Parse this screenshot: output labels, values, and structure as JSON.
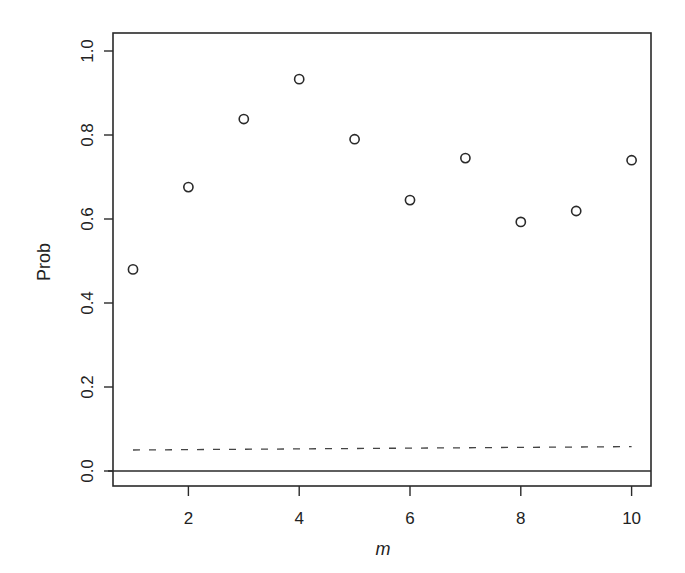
{
  "chart_data": {
    "type": "scatter",
    "title": "",
    "xlabel": "m",
    "ylabel": "Prob",
    "xlim": [
      0.65,
      10.35
    ],
    "ylim": [
      -0.04,
      1.04
    ],
    "x_ticks": [
      2,
      4,
      6,
      8,
      10
    ],
    "y_ticks": [
      0.0,
      0.2,
      0.4,
      0.6,
      0.8,
      1.0
    ],
    "x_tick_labels": [
      "2",
      "4",
      "6",
      "8",
      "10"
    ],
    "y_tick_labels": [
      "0.0",
      "0.2",
      "0.4",
      "0.6",
      "0.8",
      "1.0"
    ],
    "grid": false,
    "legend": null,
    "series": [
      {
        "name": "Prob",
        "marker": "open-circle",
        "x": [
          1,
          2,
          3,
          4,
          5,
          6,
          7,
          8,
          9,
          10
        ],
        "y": [
          0.48,
          0.676,
          0.838,
          0.933,
          0.79,
          0.645,
          0.745,
          0.593,
          0.619,
          0.74
        ]
      }
    ],
    "reference_lines": [
      {
        "name": "dashed-reference",
        "style": "dashed",
        "x": [
          1,
          10
        ],
        "y": [
          0.05,
          0.058
        ]
      },
      {
        "name": "zero-line",
        "style": "solid",
        "y": 0.0
      }
    ]
  }
}
